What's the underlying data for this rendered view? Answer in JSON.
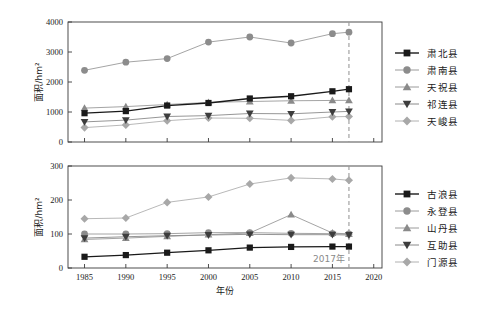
{
  "figure": {
    "background": "#ffffff",
    "annotation": {
      "text": "2017年",
      "year": 2017,
      "color": "#9a9a9a",
      "style": "dashed-vertical-line"
    }
  },
  "axis": {
    "xlabel": "年份",
    "ylabel": "面积/hm²",
    "xticks": [
      1985,
      1990,
      1995,
      2000,
      2005,
      2010,
      2015,
      2020
    ],
    "xlim": [
      1983,
      2021
    ]
  },
  "chart_data": [
    {
      "type": "line",
      "panel": "top",
      "title": "",
      "xlabel": "",
      "ylabel": "面积/hm²",
      "x": [
        1985,
        1990,
        1995,
        2000,
        2005,
        2010,
        2015,
        2017
      ],
      "xlim": [
        1983,
        2021
      ],
      "ylim": [
        0,
        4000
      ],
      "yticks": [
        0,
        1000,
        2000,
        3000,
        4000
      ],
      "xticks": [
        1985,
        1990,
        1995,
        2000,
        2005,
        2010,
        2015,
        2020
      ],
      "grid": false,
      "legend_position": "right",
      "series": [
        {
          "name": "肃北县",
          "marker": "square",
          "color": "#1a1a1a",
          "line_color": "#1a1a1a",
          "values": [
            960,
            1030,
            1215,
            1300,
            1450,
            1525,
            1690,
            1760
          ]
        },
        {
          "name": "肃南县",
          "marker": "circle",
          "color": "#8c8c8c",
          "line_color": "#9a9a9a",
          "values": [
            2390,
            2660,
            2780,
            3330,
            3500,
            3300,
            3610,
            3660
          ]
        },
        {
          "name": "天祝县",
          "marker": "triangle-up",
          "color": "#8a8a8a",
          "line_color": "#9a9a9a",
          "values": [
            1130,
            1180,
            1250,
            1320,
            1350,
            1375,
            1385,
            1390
          ]
        },
        {
          "name": "祁连县",
          "marker": "triangle-down",
          "color": "#3d3d3d",
          "line_color": "#8a8a8a",
          "values": [
            670,
            730,
            850,
            880,
            950,
            940,
            1000,
            1020
          ]
        },
        {
          "name": "天峻县",
          "marker": "diamond",
          "color": "#a8a8a8",
          "line_color": "#b0b0b0",
          "values": [
            480,
            570,
            710,
            800,
            790,
            720,
            840,
            850
          ]
        }
      ]
    },
    {
      "type": "line",
      "panel": "bottom",
      "title": "",
      "xlabel": "年份",
      "ylabel": "面积/hm²",
      "x": [
        1985,
        1990,
        1995,
        2000,
        2005,
        2010,
        2015,
        2017
      ],
      "xlim": [
        1983,
        2021
      ],
      "ylim": [
        0,
        300
      ],
      "yticks": [
        0,
        100,
        200,
        300
      ],
      "xticks": [
        1985,
        1990,
        1995,
        2000,
        2005,
        2010,
        2015,
        2020
      ],
      "grid": false,
      "legend_position": "right",
      "series": [
        {
          "name": "古浪县",
          "marker": "square",
          "color": "#1a1a1a",
          "line_color": "#1a1a1a",
          "values": [
            33,
            38,
            45,
            52,
            60,
            62,
            63,
            63
          ]
        },
        {
          "name": "永登县",
          "marker": "circle",
          "color": "#8c8c8c",
          "line_color": "#9a9a9a",
          "values": [
            100,
            100,
            101,
            104,
            104,
            102,
            101,
            100
          ]
        },
        {
          "name": "山丹县",
          "marker": "triangle-up",
          "color": "#8a8a8a",
          "line_color": "#9a9a9a",
          "values": [
            84,
            88,
            93,
            98,
            103,
            157,
            103,
            100
          ]
        },
        {
          "name": "互助县",
          "marker": "triangle-down",
          "color": "#3d3d3d",
          "line_color": "#8a8a8a",
          "values": [
            88,
            92,
            95,
            97,
            99,
            98,
            98,
            97
          ]
        },
        {
          "name": "门源县",
          "marker": "diamond",
          "color": "#a8a8a8",
          "line_color": "#b0b0b0",
          "values": [
            145,
            147,
            193,
            209,
            247,
            265,
            262,
            258
          ]
        }
      ]
    }
  ],
  "legend_top": {
    "items": [
      {
        "label": "肃北县"
      },
      {
        "label": "肃南县"
      },
      {
        "label": "天祝县"
      },
      {
        "label": "祁连县"
      },
      {
        "label": "天峻县"
      }
    ]
  },
  "legend_bottom": {
    "items": [
      {
        "label": "古浪县"
      },
      {
        "label": "永登县"
      },
      {
        "label": "山丹县"
      },
      {
        "label": "互助县"
      },
      {
        "label": "门源县"
      }
    ]
  }
}
